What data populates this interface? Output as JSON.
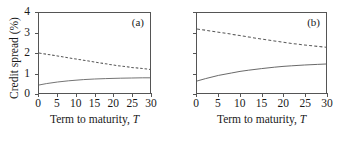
{
  "figure": {
    "ylabel": "Credit spread (%)",
    "xlabel_prefix": "Term to maturity, ",
    "xlabel_symbol": "T",
    "panel_a_tag": "(a)",
    "panel_b_tag": "(b)",
    "line_color": "#5a5a5a",
    "axis_color": "#555555"
  },
  "chart_data": [
    {
      "type": "line",
      "panel": "(a)",
      "title": "",
      "xlabel": "Term to maturity, T",
      "ylabel": "Credit spread (%)",
      "xlim": [
        0,
        30
      ],
      "ylim": [
        0,
        4
      ],
      "xticks": [
        0,
        5,
        10,
        15,
        20,
        25,
        30
      ],
      "yticks": [
        0,
        1,
        2,
        3,
        4
      ],
      "xticklabels": [
        "0",
        "5",
        "10",
        "15",
        "20",
        "25",
        "30"
      ],
      "yticklabels": [
        "0",
        "1",
        "2",
        "3",
        "4"
      ],
      "grid": false,
      "legend": "none",
      "x": [
        0,
        2,
        5,
        8,
        10,
        12,
        15,
        18,
        20,
        22,
        25,
        28,
        30
      ],
      "series": [
        {
          "name": "dashed-curve-a",
          "style": "dashed",
          "values": [
            2.0,
            1.94,
            1.85,
            1.76,
            1.7,
            1.64,
            1.55,
            1.46,
            1.4,
            1.35,
            1.28,
            1.22,
            1.18
          ]
        },
        {
          "name": "solid-curve-a",
          "style": "solid",
          "values": [
            0.4,
            0.47,
            0.55,
            0.61,
            0.64,
            0.67,
            0.7,
            0.72,
            0.73,
            0.74,
            0.75,
            0.76,
            0.76
          ]
        }
      ]
    },
    {
      "type": "line",
      "panel": "(b)",
      "title": "",
      "xlabel": "Term to maturity, T",
      "ylabel": "",
      "xlim": [
        0,
        30
      ],
      "ylim": [
        0,
        4
      ],
      "xticks": [
        0,
        5,
        10,
        15,
        20,
        25,
        30
      ],
      "yticks": [
        0,
        1,
        2,
        3,
        4
      ],
      "xticklabels": [
        "0",
        "5",
        "10",
        "15",
        "20",
        "25",
        "30"
      ],
      "yticklabels": [
        "",
        "",
        "",
        "",
        ""
      ],
      "grid": false,
      "legend": "none",
      "x": [
        0,
        2,
        5,
        8,
        10,
        12,
        15,
        18,
        20,
        22,
        25,
        28,
        30
      ],
      "series": [
        {
          "name": "dashed-curve-b",
          "style": "dashed",
          "values": [
            3.2,
            3.14,
            3.04,
            2.94,
            2.87,
            2.8,
            2.7,
            2.6,
            2.54,
            2.48,
            2.4,
            2.33,
            2.29
          ]
        },
        {
          "name": "solid-curve-b",
          "style": "solid",
          "values": [
            0.6,
            0.72,
            0.88,
            1.0,
            1.08,
            1.14,
            1.22,
            1.29,
            1.33,
            1.36,
            1.4,
            1.43,
            1.45
          ]
        }
      ]
    }
  ]
}
